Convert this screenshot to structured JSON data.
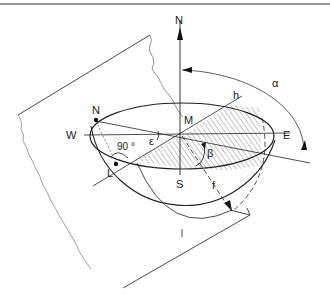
{
  "diagram": {
    "type": "celestial-hemisphere-geometry",
    "labels": {
      "north_axis": "N",
      "north_point": "N",
      "west": "W",
      "east": "E",
      "south": "S",
      "center": "M",
      "alpha": "α",
      "epsilon": "ε",
      "beta": "β",
      "h": "h",
      "f": "f",
      "L": "L",
      "right_angle": "90 °"
    },
    "colors": {
      "line": "#222222",
      "plane_edge": "#666666",
      "hatch": "#555555",
      "background": "#ffffff",
      "top_rule": "#9a9a9a"
    }
  }
}
